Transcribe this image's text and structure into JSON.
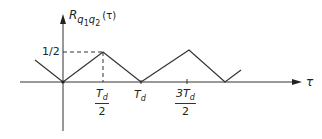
{
  "diagram": {
    "type": "triangular-wave autocorrelation plot",
    "y_axis_label": {
      "main": "R",
      "sub1": "q",
      "sub1i": "1",
      "sub2": "q",
      "sub2i": "2",
      "arg": "(τ)"
    },
    "x_axis_label": "τ",
    "y_tick_label": "1/2",
    "x_ticks": [
      {
        "id": "td2",
        "num": "T",
        "num_sub": "d",
        "den": "2"
      },
      {
        "id": "td",
        "text": "T",
        "sub": "d"
      },
      {
        "id": "3td2",
        "num": "3T",
        "num_sub": "d",
        "den": "2"
      }
    ],
    "waveform_points": [
      [
        35,
        60
      ],
      [
        63,
        82
      ],
      [
        103,
        52
      ],
      [
        141,
        82
      ],
      [
        189,
        50
      ],
      [
        225,
        82
      ],
      [
        241,
        70
      ]
    ],
    "colors": {
      "line": "#333333",
      "background": "#ffffff"
    }
  }
}
